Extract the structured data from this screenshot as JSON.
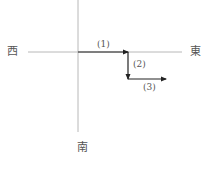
{
  "diagram": {
    "type": "direction-path",
    "axes": {
      "color": "#b8b8b8",
      "vertical": {
        "x": 78,
        "y1": 0,
        "y2": 132
      },
      "horizontal": {
        "y": 52,
        "x1": 28,
        "x2": 182
      }
    },
    "directions": {
      "west": "西",
      "east": "東",
      "south": "南"
    },
    "arrow_color": "#222222",
    "segments": [
      {
        "label": "(1)",
        "direction": "east",
        "from": [
          78,
          52
        ],
        "to": [
          128,
          52
        ]
      },
      {
        "label": "(2)",
        "direction": "south",
        "from": [
          128,
          52
        ],
        "to": [
          128,
          79
        ]
      },
      {
        "label": "(3)",
        "direction": "east",
        "from": [
          128,
          79
        ],
        "to": [
          166,
          79
        ]
      }
    ]
  }
}
